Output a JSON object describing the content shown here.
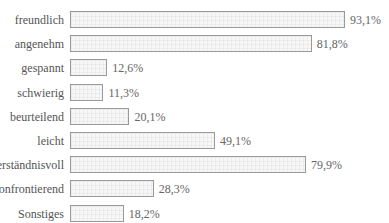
{
  "chart_data": {
    "type": "bar",
    "orientation": "horizontal",
    "title": "",
    "xlabel": "",
    "ylabel": "",
    "unit": "%",
    "categories": [
      "freundlich",
      "angenehm",
      "gespannt",
      "schwierig",
      "beurteilend",
      "leicht",
      "verständnisvoll",
      "konfrontierend",
      "Sonstiges"
    ],
    "values": [
      93.1,
      81.8,
      12.6,
      11.3,
      20.1,
      49.1,
      79.9,
      28.3,
      18.2
    ],
    "value_labels": [
      "93,1%",
      "81,8%",
      "12,6%",
      "11,3%",
      "20,1%",
      "49,1%",
      "79,9%",
      "28,3%",
      "18,2%"
    ],
    "xlim": [
      0,
      100
    ],
    "grid": false,
    "legend": false
  },
  "style": {
    "bar_border": "#999999",
    "bar_fill": "#f7f7f7",
    "text_color": "#555555"
  }
}
